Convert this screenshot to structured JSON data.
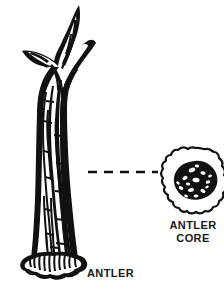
{
  "figure": {
    "background_color": "#ffffff",
    "ink_color": "#111111",
    "style": "black-and-white line drawing"
  },
  "labels": {
    "antler": "ANTLER",
    "antler_core_line1": "ANTLER",
    "antler_core_line2": "CORE"
  },
  "parts": {
    "antler_shaft": "antler-shaft",
    "main_tine": "main-tine",
    "brow_tine": "brow-tine",
    "right_tine": "right-tine",
    "burr_base": "burr-base",
    "core_outline": "antler-core-outline",
    "core_center": "antler-core-porous-center",
    "leader": "dashed-leader-line"
  },
  "leader_line": {
    "dash_count": 5,
    "from_x": 88,
    "to_x": 158,
    "y": 172
  }
}
